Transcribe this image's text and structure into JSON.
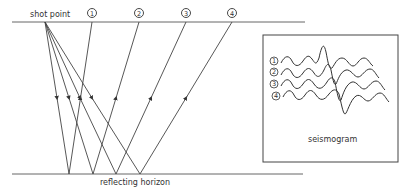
{
  "diagram": {
    "labels": {
      "shot_point": "shot point",
      "reflecting_horizon": "reflecting horizon",
      "seismogram": "seismogram"
    },
    "receivers": [
      {
        "id": "1",
        "label": "1",
        "x": 92,
        "reflection_x": 69
      },
      {
        "id": "2",
        "label": "2",
        "x": 139,
        "reflection_x": 93
      },
      {
        "id": "3",
        "label": "3",
        "x": 186,
        "reflection_x": 116
      },
      {
        "id": "4",
        "label": "4",
        "x": 232,
        "reflection_x": 140
      }
    ],
    "seismogram_traces": [
      {
        "label": "1"
      },
      {
        "label": "2"
      },
      {
        "label": "3"
      },
      {
        "label": "4"
      }
    ],
    "colors": {
      "line": "#444444",
      "text": "#333333",
      "background": "#ffffff"
    }
  }
}
